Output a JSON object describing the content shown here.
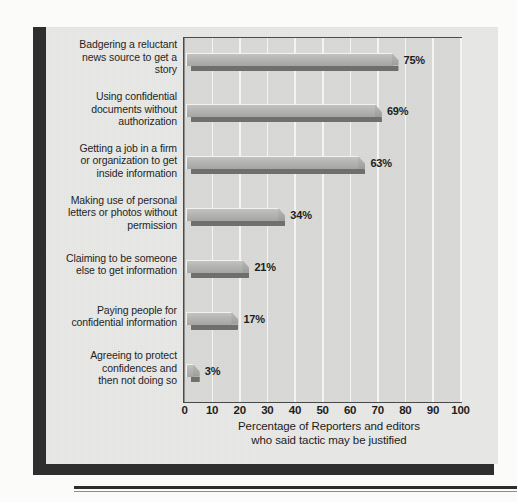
{
  "chart_data": {
    "type": "bar",
    "orientation": "horizontal",
    "title": "",
    "subtitle": "",
    "xlabel": "Percentage of Reporters and editors who said tactic may be justified",
    "ylabel": "",
    "xlim": [
      0,
      100
    ],
    "grid": true,
    "legend": null,
    "legend_position": "none",
    "xticks": [
      "0",
      "10",
      "20",
      "30",
      "40",
      "50",
      "60",
      "70",
      "80",
      "90",
      "100"
    ],
    "xtick_values": [
      0,
      10,
      20,
      30,
      40,
      50,
      60,
      70,
      80,
      90,
      100
    ],
    "categories": [
      "Badgering a reluctant news source to get a story",
      "Using confidential documents without authorization",
      "Getting a job in a firm or organization to get inside information",
      "Making use of personal letters or photos without permission",
      "Claiming to be someone else to get information",
      "Paying people for confidential information",
      "Agreeing to protect confidences and then not doing so"
    ],
    "values": [
      75,
      69,
      63,
      34,
      21,
      17,
      3
    ],
    "data_labels": [
      "75%",
      "69%",
      "63%",
      "34%",
      "21%",
      "17%",
      "3%"
    ]
  },
  "axis": {
    "caption_line1": "Percentage of Reporters and editors",
    "caption_line2": "who said tactic may be justified"
  },
  "category_labels": [
    {
      "line1": "Badgering a reluctant",
      "line2": "news source to get a",
      "line3": "story"
    },
    {
      "line1": "Using confidential",
      "line2": "documents without",
      "line3": "authorization"
    },
    {
      "line1": "Getting a job in a firm",
      "line2": "or organization to get",
      "line3": "inside information"
    },
    {
      "line1": "Making use of personal",
      "line2": "letters or photos without",
      "line3": "permission"
    },
    {
      "line1": "Claiming to be someone",
      "line2": "else to get information",
      "line3": ""
    },
    {
      "line1": "Paying people for",
      "line2": "confidential information",
      "line3": ""
    },
    {
      "line1": "Agreeing to protect",
      "line2": "confidences and",
      "line3": "then not doing so"
    }
  ],
  "colors": {
    "panel_background": "#e9e9e7",
    "plot_background": "#d9d9d7",
    "bar_face": "#b4b4b2",
    "bar_shadow": "#6f6f6d",
    "gridline": "#f4f4f2",
    "axis_line": "#4a4a4a",
    "frame": "#2e2e2e",
    "text": "#1d1d1d"
  }
}
